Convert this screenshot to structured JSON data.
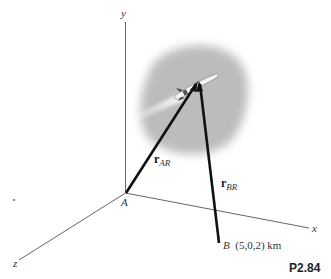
{
  "figure": {
    "problem_label": "P2.84",
    "axes": {
      "x_label": "x",
      "y_label": "y",
      "z_label": "z"
    },
    "points": {
      "A": {
        "label": "A"
      },
      "B": {
        "label": "B",
        "coords": "(5,0,2) km"
      }
    },
    "vectors": {
      "r_AR": {
        "symbol": "r",
        "subscript": "AR"
      },
      "r_BR": {
        "symbol": "r",
        "subscript": "BR"
      }
    },
    "object": "rocket in cloud",
    "colors": {
      "axis": "#555555",
      "vector": "#111111",
      "cloud": "#b8b8b8"
    }
  }
}
